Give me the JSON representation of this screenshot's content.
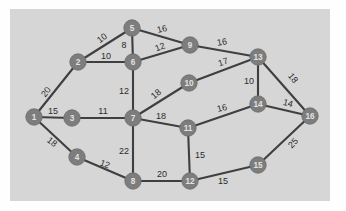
{
  "figure": {
    "panel_background": "#d6d6d6",
    "page_background": "#fefefe",
    "node_fill": "#7d7d7d",
    "node_text_color": "#e2e2e2",
    "edge_color": "#3f3f3f",
    "label_color": "#2b2b2b"
  },
  "chart_data": {
    "type": "diagram",
    "diagram_kind": "weighted undirected graph",
    "title": "",
    "xlabel": "",
    "ylabel": "",
    "grid": false,
    "legend": null,
    "node_count": 16,
    "edge_count": 27,
    "nodes": [
      {
        "id": "1",
        "label": "1",
        "x": 24,
        "y": 108
      },
      {
        "id": "2",
        "label": "2",
        "x": 68,
        "y": 53
      },
      {
        "id": "3",
        "label": "3",
        "x": 62,
        "y": 109
      },
      {
        "id": "4",
        "label": "4",
        "x": 67,
        "y": 148
      },
      {
        "id": "5",
        "label": "5",
        "x": 122,
        "y": 19
      },
      {
        "id": "6",
        "label": "6",
        "x": 123,
        "y": 53
      },
      {
        "id": "7",
        "label": "7",
        "x": 123,
        "y": 109
      },
      {
        "id": "8",
        "label": "8",
        "x": 123,
        "y": 172
      },
      {
        "id": "9",
        "label": "9",
        "x": 180,
        "y": 36
      },
      {
        "id": "10",
        "label": "10",
        "x": 179,
        "y": 74
      },
      {
        "id": "11",
        "label": "11",
        "x": 178,
        "y": 119
      },
      {
        "id": "12",
        "label": "12",
        "x": 180,
        "y": 172
      },
      {
        "id": "13",
        "label": "13",
        "x": 248,
        "y": 48
      },
      {
        "id": "14",
        "label": "14",
        "x": 248,
        "y": 95
      },
      {
        "id": "15",
        "label": "15",
        "x": 248,
        "y": 156
      },
      {
        "id": "16",
        "label": "16",
        "x": 300,
        "y": 107
      }
    ],
    "edges": [
      {
        "source": "1",
        "target": "2",
        "weight": 20,
        "label_x": 36,
        "label_y": 83,
        "rotate": -52
      },
      {
        "source": "1",
        "target": "3",
        "weight": 15,
        "label_x": 43,
        "label_y": 102,
        "rotate": 0
      },
      {
        "source": "1",
        "target": "4",
        "weight": 18,
        "label_x": 42,
        "label_y": 133,
        "rotate": 38
      },
      {
        "source": "2",
        "target": "5",
        "weight": 10,
        "label_x": 92,
        "label_y": 29,
        "rotate": -37
      },
      {
        "source": "2",
        "target": "6",
        "weight": 10,
        "label_x": 96,
        "label_y": 47,
        "rotate": 0
      },
      {
        "source": "3",
        "target": "7",
        "weight": 11,
        "label_x": 93,
        "label_y": 102,
        "rotate": 0
      },
      {
        "source": "4",
        "target": "8",
        "weight": 12,
        "label_x": 95,
        "label_y": 155,
        "rotate": 22
      },
      {
        "source": "5",
        "target": "6",
        "weight": 8,
        "label_x": 114,
        "label_y": 36,
        "rotate": 0
      },
      {
        "source": "5",
        "target": "9",
        "weight": 16,
        "label_x": 152,
        "label_y": 20,
        "rotate": -14
      },
      {
        "source": "6",
        "target": "9",
        "weight": 12,
        "label_x": 150,
        "label_y": 38,
        "rotate": -20
      },
      {
        "source": "6",
        "target": "7",
        "weight": 12,
        "label_x": 114,
        "label_y": 82,
        "rotate": 0
      },
      {
        "source": "7",
        "target": "10",
        "weight": 18,
        "label_x": 146,
        "label_y": 85,
        "rotate": -40
      },
      {
        "source": "7",
        "target": "11",
        "weight": 18,
        "label_x": 151,
        "label_y": 107,
        "rotate": 0
      },
      {
        "source": "7",
        "target": "8",
        "weight": 22,
        "label_x": 114,
        "label_y": 142,
        "rotate": 0
      },
      {
        "source": "8",
        "target": "12",
        "weight": 20,
        "label_x": 152,
        "label_y": 165,
        "rotate": 0
      },
      {
        "source": "9",
        "target": "13",
        "weight": 16,
        "label_x": 212,
        "label_y": 33,
        "rotate": -10
      },
      {
        "source": "10",
        "target": "13",
        "weight": 17,
        "label_x": 213,
        "label_y": 53,
        "rotate": -18
      },
      {
        "source": "11",
        "target": "14",
        "weight": 16,
        "label_x": 212,
        "label_y": 99,
        "rotate": -14
      },
      {
        "source": "11",
        "target": "12",
        "weight": 15,
        "label_x": 190,
        "label_y": 146,
        "rotate": 0
      },
      {
        "source": "12",
        "target": "15",
        "weight": 15,
        "label_x": 213,
        "label_y": 172,
        "rotate": 0
      },
      {
        "source": "13",
        "target": "14",
        "weight": 10,
        "label_x": 239,
        "label_y": 72,
        "rotate": 0
      },
      {
        "source": "13",
        "target": "16",
        "weight": 18,
        "label_x": 283,
        "label_y": 69,
        "rotate": 52
      },
      {
        "source": "14",
        "target": "16",
        "weight": 14,
        "label_x": 278,
        "label_y": 94,
        "rotate": 14
      },
      {
        "source": "15",
        "target": "16",
        "weight": 25,
        "label_x": 283,
        "label_y": 134,
        "rotate": -46
      }
    ]
  }
}
